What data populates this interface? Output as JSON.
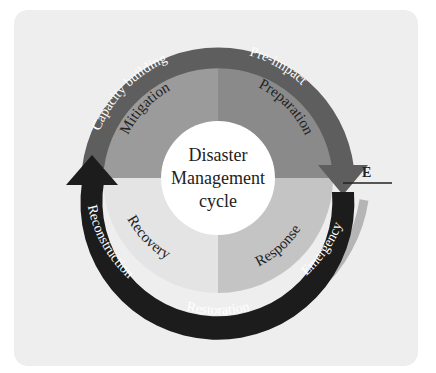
{
  "diagram": {
    "title_lines": [
      "Disaster",
      "Management",
      "cycle"
    ],
    "quadrants": [
      {
        "label": "Mitigation",
        "position": "top-left",
        "color": "#9b9b9b"
      },
      {
        "label": "Preparation",
        "position": "top-right",
        "color": "#8a8a8a"
      },
      {
        "label": "Response",
        "position": "bottom-right",
        "color": "#c4c4c4"
      },
      {
        "label": "Recovery",
        "position": "bottom-left",
        "color": "#e4e4e4"
      }
    ],
    "outer_band": {
      "labels": {
        "capacity_building": "Capacity building",
        "pre_impact": "Pre-impact",
        "emergency": "Emergency",
        "restoration": "Restoration",
        "reconstruction": "Reconstruction"
      },
      "colors": {
        "pre_phase": "#5e5e5e",
        "post_phase": "#1c1c1c",
        "outer_trail": "#b5b5b5"
      }
    },
    "event_marker": {
      "label": "E"
    },
    "colors": {
      "panel_background": "#eeeeee",
      "center_circle": "#ffffff",
      "text_dark": "#222222",
      "text_light": "#ffffff"
    }
  }
}
